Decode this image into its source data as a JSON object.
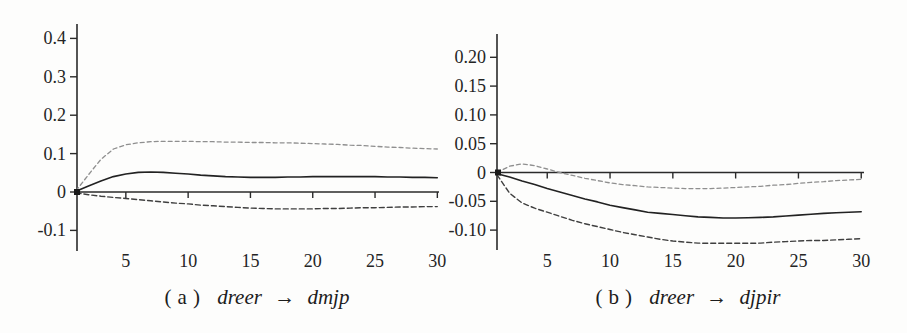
{
  "figure": {
    "background": "#fdfdfc",
    "axis_color": "#2a2a2a",
    "tick_label_color": "#242424"
  },
  "chart_data": [
    {
      "type": "line",
      "panel": "a",
      "caption": {
        "prefix": "(a)",
        "source": "dreer",
        "arrow": "→",
        "target": "dmjp"
      },
      "title": "",
      "xlabel": "",
      "ylabel": "",
      "grid": false,
      "legend": "none",
      "xlim": [
        1,
        30
      ],
      "ylim": [
        -0.15,
        0.44
      ],
      "xticks": [
        5,
        10,
        15,
        20,
        25,
        30
      ],
      "yticks": [
        0.4,
        0.3,
        0.2,
        0.1,
        0,
        -0.1
      ],
      "ytick_labels": [
        "0.4",
        "0.3",
        "0.2",
        "0.1",
        "0",
        "-0.1"
      ],
      "x": [
        1,
        2,
        3,
        4,
        5,
        6,
        7,
        8,
        9,
        10,
        11,
        12,
        13,
        14,
        15,
        16,
        17,
        18,
        19,
        20,
        21,
        22,
        23,
        24,
        25,
        26,
        27,
        28,
        29,
        30
      ],
      "series": [
        {
          "name": "upper-band",
          "style": "dashed",
          "color": "#8f8f8f",
          "width": 1.3,
          "dash": "4 3",
          "values": [
            0.003,
            0.045,
            0.085,
            0.112,
            0.123,
            0.128,
            0.131,
            0.132,
            0.132,
            0.132,
            0.131,
            0.131,
            0.13,
            0.13,
            0.129,
            0.129,
            0.128,
            0.128,
            0.127,
            0.126,
            0.125,
            0.124,
            0.122,
            0.121,
            0.119,
            0.117,
            0.116,
            0.114,
            0.113,
            0.112
          ]
        },
        {
          "name": "irf",
          "style": "solid",
          "color": "#222222",
          "width": 1.6,
          "dash": "",
          "values": [
            0.002,
            0.016,
            0.029,
            0.04,
            0.047,
            0.051,
            0.052,
            0.051,
            0.049,
            0.047,
            0.044,
            0.042,
            0.04,
            0.039,
            0.038,
            0.038,
            0.038,
            0.039,
            0.039,
            0.04,
            0.04,
            0.04,
            0.04,
            0.04,
            0.04,
            0.039,
            0.039,
            0.038,
            0.038,
            0.037
          ]
        },
        {
          "name": "lower-band",
          "style": "dashed",
          "color": "#3f3f3f",
          "width": 1.4,
          "dash": "5 3",
          "values": [
            -0.002,
            -0.007,
            -0.011,
            -0.014,
            -0.017,
            -0.02,
            -0.023,
            -0.026,
            -0.029,
            -0.031,
            -0.034,
            -0.036,
            -0.038,
            -0.04,
            -0.042,
            -0.043,
            -0.044,
            -0.044,
            -0.044,
            -0.044,
            -0.043,
            -0.043,
            -0.042,
            -0.041,
            -0.041,
            -0.04,
            -0.039,
            -0.039,
            -0.038,
            -0.038
          ]
        }
      ]
    },
    {
      "type": "line",
      "panel": "b",
      "caption": {
        "prefix": "(b)",
        "source": "dreer",
        "arrow": "→",
        "target": "djpir"
      },
      "title": "",
      "xlabel": "",
      "ylabel": "",
      "grid": false,
      "legend": "none",
      "xlim": [
        1,
        30
      ],
      "ylim": [
        -0.14,
        0.24
      ],
      "xticks": [
        5,
        10,
        15,
        20,
        25,
        30
      ],
      "yticks": [
        0.2,
        0.15,
        0.1,
        0.05,
        0,
        -0.05,
        -0.1
      ],
      "ytick_labels": [
        "0.20",
        "0.15",
        "0.10",
        "0.05",
        "0",
        "-0.05",
        "-0.10"
      ],
      "x": [
        1,
        2,
        3,
        4,
        5,
        6,
        7,
        8,
        9,
        10,
        11,
        12,
        13,
        14,
        15,
        16,
        17,
        18,
        19,
        20,
        21,
        22,
        23,
        24,
        25,
        26,
        27,
        28,
        29,
        30
      ],
      "series": [
        {
          "name": "upper-band",
          "style": "dashed",
          "color": "#8f8f8f",
          "width": 1.3,
          "dash": "4 3",
          "values": [
            0.0,
            0.011,
            0.015,
            0.012,
            0.006,
            0.0,
            -0.005,
            -0.01,
            -0.014,
            -0.018,
            -0.021,
            -0.023,
            -0.025,
            -0.026,
            -0.027,
            -0.028,
            -0.028,
            -0.028,
            -0.027,
            -0.026,
            -0.025,
            -0.024,
            -0.022,
            -0.021,
            -0.019,
            -0.017,
            -0.016,
            -0.014,
            -0.013,
            -0.012
          ]
        },
        {
          "name": "irf",
          "style": "solid",
          "color": "#222222",
          "width": 1.6,
          "dash": "",
          "values": [
            -0.002,
            -0.008,
            -0.015,
            -0.021,
            -0.028,
            -0.034,
            -0.04,
            -0.046,
            -0.051,
            -0.057,
            -0.061,
            -0.065,
            -0.069,
            -0.071,
            -0.073,
            -0.075,
            -0.077,
            -0.078,
            -0.079,
            -0.079,
            -0.0785,
            -0.078,
            -0.077,
            -0.0755,
            -0.074,
            -0.0725,
            -0.071,
            -0.07,
            -0.069,
            -0.068
          ]
        },
        {
          "name": "lower-band",
          "style": "dashed",
          "color": "#3f3f3f",
          "width": 1.4,
          "dash": "5 3",
          "values": [
            -0.004,
            -0.036,
            -0.053,
            -0.062,
            -0.069,
            -0.076,
            -0.083,
            -0.089,
            -0.094,
            -0.099,
            -0.104,
            -0.108,
            -0.112,
            -0.116,
            -0.119,
            -0.121,
            -0.1225,
            -0.123,
            -0.123,
            -0.123,
            -0.123,
            -0.1225,
            -0.121,
            -0.12,
            -0.119,
            -0.118,
            -0.118,
            -0.117,
            -0.116,
            -0.115
          ]
        }
      ]
    }
  ]
}
